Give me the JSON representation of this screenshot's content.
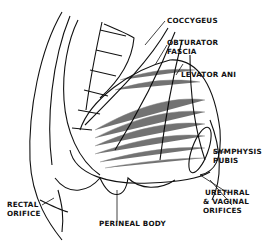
{
  "diagram": {
    "labels": {
      "coccygeus": "COCCYGEUS",
      "obturator_fascia_1": "OBTURATOR",
      "obturator_fascia_2": "FASCIA",
      "levator_ani": "LEVATOR ANI",
      "symphysis_pubis_1": "SYMPHYSIS",
      "symphysis_pubis_2": "PUBIS",
      "urethral_vaginal_1": "URETHRAL",
      "urethral_vaginal_2": "& VAGINAL",
      "urethral_vaginal_3": "ORIFICES",
      "rectal_orifice_1": "RECTAL",
      "rectal_orifice_2": "ORIFICE",
      "perineal_body": "PERINEAL BODY"
    },
    "colors": {
      "ink": "#111111",
      "background": "#ffffff"
    }
  }
}
